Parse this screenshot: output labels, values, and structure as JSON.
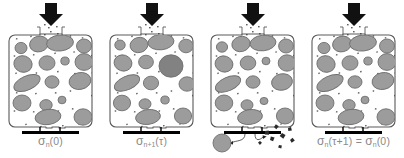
{
  "figure": {
    "background": "#ffffff",
    "width": 404,
    "height": 158,
    "colors": {
      "grain_fill": "#9c9c9c",
      "grain_stroke": "#6f6f6f",
      "grain_dark_fill": "#828282",
      "container_stroke": "#5a5a5a",
      "arrow_black": "#111111",
      "speck": "#3a3a3a",
      "caption_text": "#8a8a8a",
      "plate_black": "#000000"
    },
    "panels": [
      {
        "id": "panel-1",
        "index": 1,
        "caption_sigma": "σ",
        "caption_sub": "n",
        "caption_arg": "(0)",
        "caption_plain": "σn(0)",
        "state": "initial-packing",
        "outlet": "closed",
        "feed_arrow": "down",
        "grains": [
          {
            "cx": 21,
            "cy": 48,
            "rx": 6.0,
            "ry": 5.6,
            "rot": 0
          },
          {
            "cx": 39,
            "cy": 44,
            "rx": 9.5,
            "ry": 7.8,
            "rot": -14
          },
          {
            "cx": 60,
            "cy": 43,
            "rx": 13.5,
            "ry": 8.0,
            "rot": -6
          },
          {
            "cx": 84,
            "cy": 46,
            "rx": 7.5,
            "ry": 7.0,
            "rot": 0
          },
          {
            "cx": 23,
            "cy": 64,
            "rx": 9.2,
            "ry": 8.2,
            "rot": 18
          },
          {
            "cx": 47,
            "cy": 63,
            "rx": 8.0,
            "ry": 7.2,
            "rot": 0
          },
          {
            "cx": 65,
            "cy": 61,
            "rx": 4.2,
            "ry": 4.0,
            "rot": 0
          },
          {
            "cx": 84,
            "cy": 62,
            "rx": 9.0,
            "ry": 8.4,
            "rot": 0
          },
          {
            "cx": 27,
            "cy": 83,
            "rx": 14.0,
            "ry": 7.0,
            "rot": -24
          },
          {
            "cx": 52,
            "cy": 82,
            "rx": 7.0,
            "ry": 6.2,
            "rot": 0
          },
          {
            "cx": 80,
            "cy": 81,
            "rx": 11.0,
            "ry": 8.4,
            "rot": -12
          },
          {
            "cx": 22,
            "cy": 103,
            "rx": 9.0,
            "ry": 8.0,
            "rot": 0
          },
          {
            "cx": 46,
            "cy": 105,
            "rx": 6.2,
            "ry": 5.4,
            "rot": 0
          },
          {
            "cx": 62,
            "cy": 100,
            "rx": 4.0,
            "ry": 3.8,
            "rot": 0
          },
          {
            "cx": 48,
            "cy": 117,
            "rx": 13.0,
            "ry": 7.6,
            "rot": -8
          },
          {
            "cx": 83,
            "cy": 117,
            "rx": 9.0,
            "ry": 8.2,
            "rot": 0
          }
        ]
      },
      {
        "id": "panel-2",
        "index": 2,
        "caption_sigma": "σ",
        "caption_sub": "n+1",
        "caption_arg": "(τ)",
        "caption_plain": "σn+1(τ)",
        "state": "aggregated-grain-grown",
        "outlet": "closed",
        "feed_arrow": "down",
        "grains": [
          {
            "cx": 19,
            "cy": 45,
            "rx": 5.2,
            "ry": 5.0,
            "rot": 0
          },
          {
            "cx": 38,
            "cy": 45,
            "rx": 9.0,
            "ry": 7.6,
            "rot": -14
          },
          {
            "cx": 60,
            "cy": 42,
            "rx": 13.0,
            "ry": 7.8,
            "rot": -6
          },
          {
            "cx": 85,
            "cy": 46,
            "rx": 7.2,
            "ry": 6.8,
            "rot": 0
          },
          {
            "cx": 22,
            "cy": 63,
            "rx": 9.0,
            "ry": 8.0,
            "rot": 18
          },
          {
            "cx": 45,
            "cy": 62,
            "rx": 7.4,
            "ry": 6.8,
            "rot": 0
          },
          {
            "cx": 70,
            "cy": 66,
            "rx": 12.0,
            "ry": 11.2,
            "rot": 0,
            "dark": true
          },
          {
            "cx": 26,
            "cy": 83,
            "rx": 13.5,
            "ry": 6.8,
            "rot": -24
          },
          {
            "cx": 50,
            "cy": 83,
            "rx": 7.6,
            "ry": 6.8,
            "rot": 0
          },
          {
            "cx": 86,
            "cy": 84,
            "rx": 8.0,
            "ry": 7.2,
            "rot": 0
          },
          {
            "cx": 21,
            "cy": 103,
            "rx": 8.6,
            "ry": 7.8,
            "rot": 0
          },
          {
            "cx": 44,
            "cy": 104,
            "rx": 6.0,
            "ry": 5.2,
            "rot": 0
          },
          {
            "cx": 64,
            "cy": 100,
            "rx": 4.2,
            "ry": 4.0,
            "rot": 0
          },
          {
            "cx": 47,
            "cy": 117,
            "rx": 12.5,
            "ry": 7.4,
            "rot": -8
          },
          {
            "cx": 82,
            "cy": 116,
            "rx": 8.6,
            "ry": 8.0,
            "rot": 0
          }
        ]
      },
      {
        "id": "panel-3",
        "index": 3,
        "caption_sigma": "",
        "caption_sub": "",
        "caption_arg": "",
        "caption_plain": "",
        "state": "discharge-and-fragmentation",
        "outlet": "open",
        "feed_arrow": "down",
        "grains": [
          {
            "cx": 20,
            "cy": 47,
            "rx": 5.6,
            "ry": 5.2,
            "rot": 0
          },
          {
            "cx": 39,
            "cy": 44,
            "rx": 9.2,
            "ry": 7.6,
            "rot": -14
          },
          {
            "cx": 61,
            "cy": 43,
            "rx": 13.0,
            "ry": 7.8,
            "rot": -6
          },
          {
            "cx": 84,
            "cy": 46,
            "rx": 7.4,
            "ry": 7.0,
            "rot": 0
          },
          {
            "cx": 22,
            "cy": 64,
            "rx": 9.0,
            "ry": 8.0,
            "rot": 18
          },
          {
            "cx": 46,
            "cy": 63,
            "rx": 7.8,
            "ry": 7.0,
            "rot": 0
          },
          {
            "cx": 64,
            "cy": 61,
            "rx": 4.0,
            "ry": 3.8,
            "rot": 0
          },
          {
            "cx": 85,
            "cy": 63,
            "rx": 8.8,
            "ry": 8.2,
            "rot": 0
          },
          {
            "cx": 26,
            "cy": 84,
            "rx": 13.5,
            "ry": 6.8,
            "rot": -24
          },
          {
            "cx": 51,
            "cy": 82,
            "rx": 7.0,
            "ry": 6.2,
            "rot": 0
          },
          {
            "cx": 80,
            "cy": 82,
            "rx": 10.5,
            "ry": 8.2,
            "rot": -12
          },
          {
            "cx": 22,
            "cy": 103,
            "rx": 8.8,
            "ry": 8.0,
            "rot": 0
          },
          {
            "cx": 45,
            "cy": 105,
            "rx": 6.0,
            "ry": 5.2,
            "rot": 0
          },
          {
            "cx": 62,
            "cy": 101,
            "rx": 4.0,
            "ry": 3.6,
            "rot": 0
          },
          {
            "cx": 48,
            "cy": 117,
            "rx": 12.5,
            "ry": 7.4,
            "rot": -8
          },
          {
            "cx": 83,
            "cy": 116,
            "rx": 8.6,
            "ry": 8.0,
            "rot": 0
          }
        ],
        "ejecta": {
          "grain": {
            "cx": 20,
            "cy": 143,
            "r": 9.0
          },
          "fragments": [
            {
              "x": 63,
              "y": 131,
              "s": 3.4,
              "rot": 20
            },
            {
              "x": 72,
              "y": 127,
              "s": 3.0,
              "rot": -30
            },
            {
              "x": 80,
              "y": 133,
              "s": 3.6,
              "rot": 55
            },
            {
              "x": 86,
              "y": 128,
              "s": 2.8,
              "rot": 10
            },
            {
              "x": 68,
              "y": 140,
              "s": 3.2,
              "rot": -50
            },
            {
              "x": 77,
              "y": 145,
              "s": 2.6,
              "rot": 35
            },
            {
              "x": 88,
              "y": 140,
              "s": 3.0,
              "rot": -15
            },
            {
              "x": 58,
              "y": 141,
              "s": 2.4,
              "rot": 70
            }
          ]
        }
      },
      {
        "id": "panel-4",
        "index": 4,
        "caption_sigma": "σ",
        "caption_sub": "n",
        "caption_arg": "(τ+1) = ",
        "caption_sigma2": "σ",
        "caption_sub2": "n",
        "caption_arg2": "(0)",
        "caption_plain": "σn(τ+1) = σn(0)",
        "state": "reset-packing",
        "outlet": "closed",
        "feed_arrow": "down",
        "grains": [
          {
            "cx": 21,
            "cy": 48,
            "rx": 6.0,
            "ry": 5.6,
            "rot": 0
          },
          {
            "cx": 39,
            "cy": 44,
            "rx": 9.5,
            "ry": 7.8,
            "rot": -14
          },
          {
            "cx": 60,
            "cy": 43,
            "rx": 13.5,
            "ry": 8.0,
            "rot": -6
          },
          {
            "cx": 84,
            "cy": 46,
            "rx": 7.5,
            "ry": 7.0,
            "rot": 0
          },
          {
            "cx": 23,
            "cy": 64,
            "rx": 9.2,
            "ry": 8.2,
            "rot": 18
          },
          {
            "cx": 47,
            "cy": 63,
            "rx": 8.0,
            "ry": 7.2,
            "rot": 0
          },
          {
            "cx": 65,
            "cy": 61,
            "rx": 4.2,
            "ry": 4.0,
            "rot": 0
          },
          {
            "cx": 84,
            "cy": 62,
            "rx": 9.0,
            "ry": 8.4,
            "rot": 0
          },
          {
            "cx": 27,
            "cy": 83,
            "rx": 14.0,
            "ry": 7.0,
            "rot": -24
          },
          {
            "cx": 52,
            "cy": 82,
            "rx": 7.0,
            "ry": 6.2,
            "rot": 0
          },
          {
            "cx": 80,
            "cy": 81,
            "rx": 11.0,
            "ry": 8.4,
            "rot": -12
          },
          {
            "cx": 22,
            "cy": 103,
            "rx": 9.0,
            "ry": 8.0,
            "rot": 0
          },
          {
            "cx": 46,
            "cy": 105,
            "rx": 6.2,
            "ry": 5.4,
            "rot": 0
          },
          {
            "cx": 62,
            "cy": 100,
            "rx": 4.0,
            "ry": 3.8,
            "rot": 0
          },
          {
            "cx": 48,
            "cy": 117,
            "rx": 13.0,
            "ry": 7.6,
            "rot": -8
          },
          {
            "cx": 83,
            "cy": 117,
            "rx": 9.0,
            "ry": 8.2,
            "rot": 0
          }
        ]
      }
    ],
    "specks": [
      {
        "x": 16,
        "y": 38
      },
      {
        "x": 30,
        "y": 36
      },
      {
        "x": 44,
        "y": 34
      },
      {
        "x": 57,
        "y": 33
      },
      {
        "x": 70,
        "y": 35
      },
      {
        "x": 82,
        "y": 37
      },
      {
        "x": 92,
        "y": 40
      },
      {
        "x": 14,
        "y": 55
      },
      {
        "x": 33,
        "y": 54
      },
      {
        "x": 54,
        "y": 53
      },
      {
        "x": 73,
        "y": 52
      },
      {
        "x": 91,
        "y": 55
      },
      {
        "x": 15,
        "y": 73
      },
      {
        "x": 36,
        "y": 72
      },
      {
        "x": 57,
        "y": 71
      },
      {
        "x": 74,
        "y": 73
      },
      {
        "x": 92,
        "y": 72
      },
      {
        "x": 16,
        "y": 92
      },
      {
        "x": 35,
        "y": 93
      },
      {
        "x": 55,
        "y": 92
      },
      {
        "x": 70,
        "y": 90
      },
      {
        "x": 91,
        "y": 95
      },
      {
        "x": 14,
        "y": 110
      },
      {
        "x": 33,
        "y": 111
      },
      {
        "x": 58,
        "y": 110
      },
      {
        "x": 72,
        "y": 108
      },
      {
        "x": 93,
        "y": 107
      },
      {
        "x": 25,
        "y": 124
      },
      {
        "x": 40,
        "y": 126
      },
      {
        "x": 62,
        "y": 125
      },
      {
        "x": 78,
        "y": 124
      },
      {
        "x": 92,
        "y": 122
      },
      {
        "x": 50,
        "y": 31
      },
      {
        "x": 48,
        "y": 27
      },
      {
        "x": 56,
        "y": 26
      },
      {
        "x": 44,
        "y": 24
      }
    ]
  }
}
